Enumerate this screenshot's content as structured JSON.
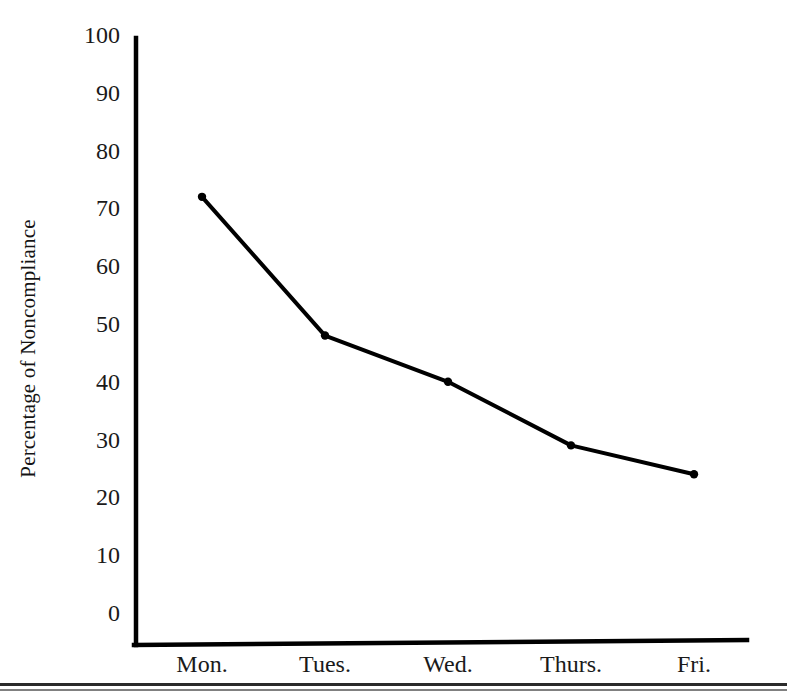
{
  "chart_data": {
    "type": "line",
    "title": "",
    "xlabel": "",
    "ylabel": "Percentage of Noncompliance",
    "categories": [
      "Mon.",
      "Tues.",
      "Wed.",
      "Thurs.",
      "Fri."
    ],
    "values": [
      72,
      48,
      40,
      29,
      24
    ],
    "series": [
      {
        "name": "Percentage of Noncompliance",
        "values": [
          72,
          48,
          40,
          29,
          24
        ]
      }
    ],
    "ylim": [
      0,
      100
    ],
    "ytick_values": [
      0,
      10,
      20,
      30,
      40,
      50,
      60,
      70,
      80,
      90,
      100
    ],
    "ytick_labels": [
      "0",
      "10",
      "20",
      "30",
      "40",
      "50",
      "60",
      "70",
      "80",
      "90",
      "100"
    ],
    "grid": false,
    "legend": false,
    "legend_position": "none",
    "marker": "dot",
    "line_color": "#000000",
    "axis_color": "#000000"
  },
  "axes": {
    "y_title": "Percentage of Noncompliance"
  }
}
